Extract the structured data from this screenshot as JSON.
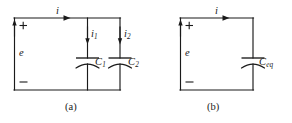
{
  "figure": {
    "background_color": "#ffffff",
    "ink_color": "#1a1a1a",
    "width": 292,
    "height": 123
  },
  "circuit_a": {
    "caption": "(a)",
    "source": {
      "symbol_label": "e",
      "plus_sign": "+",
      "minus_sign": "−",
      "polarity_arrow": "up-arrow"
    },
    "total_current": {
      "label": "i",
      "arrow": "right-arrow"
    },
    "branches": [
      {
        "current_label": "i",
        "current_subscript": "1",
        "current_arrow": "down-arrow",
        "component_label": "C",
        "component_subscript": "1",
        "component_type": "capacitor"
      },
      {
        "current_label": "i",
        "current_subscript": "2",
        "current_arrow": "down-arrow",
        "component_label": "C",
        "component_subscript": "2",
        "component_type": "capacitor"
      }
    ]
  },
  "circuit_b": {
    "caption": "(b)",
    "source": {
      "symbol_label": "e",
      "plus_sign": "+",
      "minus_sign": "−",
      "polarity_arrow": "up-arrow"
    },
    "total_current": {
      "label": "i",
      "arrow": "right-arrow"
    },
    "branches": [
      {
        "component_label": "C",
        "component_subscript": "eq",
        "component_type": "capacitor"
      }
    ]
  }
}
